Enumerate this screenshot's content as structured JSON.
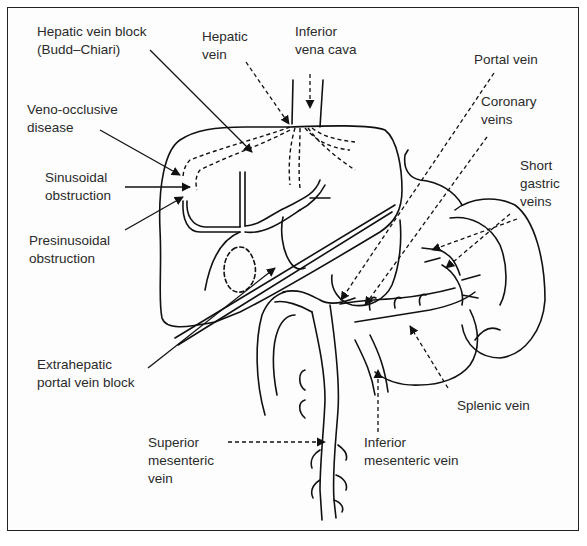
{
  "diagram": {
    "type": "anatomical-line-drawing",
    "colors": {
      "stroke": "#111111",
      "text": "#2a2a2a",
      "background": "#fdfdfd",
      "frame": "#222222"
    },
    "labels": {
      "hepatic_vein_block": {
        "line1": "Hepatic vein block",
        "line2": "(Budd–Chiari)"
      },
      "hepatic_vein": {
        "line1": "Hepatic",
        "line2": "vein"
      },
      "inferior_vena_cava": {
        "line1": "Inferior",
        "line2": "vena cava"
      },
      "portal_vein": {
        "line1": "Portal vein"
      },
      "coronary_veins": {
        "line1": "Coronary",
        "line2": "veins"
      },
      "veno_occlusive": {
        "line1": "Veno-occlusive",
        "line2": "disease"
      },
      "sinusoidal": {
        "line1": "Sinusoidal",
        "line2": "obstruction"
      },
      "short_gastric": {
        "line1": "Short",
        "line2": "gastric",
        "line3": "veins"
      },
      "presinusoidal": {
        "line1": "Presinusoidal",
        "line2": "obstruction"
      },
      "extrahepatic": {
        "line1": "Extrahepatic",
        "line2": "portal vein block"
      },
      "splenic_vein": {
        "line1": "Splenic vein"
      },
      "superior_mesenteric": {
        "line1": "Superior",
        "line2": "mesenteric",
        "line3": "vein"
      },
      "inferior_mesenteric": {
        "line1": "Inferior",
        "line2": "mesenteric vein"
      }
    },
    "leader_styles": {
      "solid": [
        "hepatic_vein_block",
        "veno_occlusive",
        "sinusoidal",
        "presinusoidal",
        "extrahepatic"
      ],
      "dashed": [
        "hepatic_vein",
        "inferior_vena_cava",
        "portal_vein",
        "coronary_veins",
        "short_gastric",
        "splenic_vein",
        "superior_mesenteric",
        "inferior_mesenteric"
      ]
    }
  }
}
